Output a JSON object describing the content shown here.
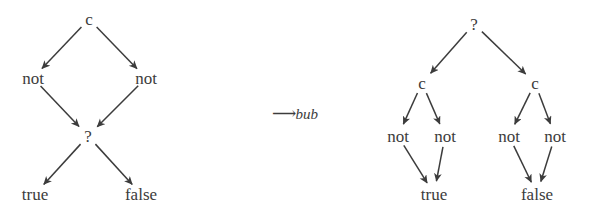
{
  "figure": {
    "kind": "term-rewriting-diagram",
    "background_color": "#ffffff",
    "ink_color": "#3c3c3c",
    "relation": {
      "arrow_glyph": "⟶",
      "name": "bub",
      "full_text": "⟶bub"
    },
    "left_tree": {
      "name": "source-term-tree",
      "nodes": [
        {
          "id": "l-c",
          "label": "c",
          "x": 89,
          "y": 19
        },
        {
          "id": "l-not-1",
          "label": "not",
          "x": 33,
          "y": 78
        },
        {
          "id": "l-not-2",
          "label": "not",
          "x": 146,
          "y": 78
        },
        {
          "id": "l-q",
          "label": "?",
          "x": 88,
          "y": 136
        },
        {
          "id": "l-true",
          "label": "true",
          "x": 35,
          "y": 194
        },
        {
          "id": "l-false",
          "label": "false",
          "x": 141,
          "y": 194
        }
      ],
      "edges": [
        {
          "from": "l-c",
          "to": "l-not-1"
        },
        {
          "from": "l-c",
          "to": "l-not-2"
        },
        {
          "from": "l-not-1",
          "to": "l-q"
        },
        {
          "from": "l-not-2",
          "to": "l-q"
        },
        {
          "from": "l-q",
          "to": "l-true"
        },
        {
          "from": "l-q",
          "to": "l-false"
        }
      ]
    },
    "right_tree": {
      "name": "result-term-tree",
      "nodes": [
        {
          "id": "r-q",
          "label": "?",
          "x": 474,
          "y": 24
        },
        {
          "id": "r-c-1",
          "label": "c",
          "x": 422,
          "y": 83
        },
        {
          "id": "r-c-2",
          "label": "c",
          "x": 535,
          "y": 83
        },
        {
          "id": "r-not-1",
          "label": "not",
          "x": 398,
          "y": 136
        },
        {
          "id": "r-not-2",
          "label": "not",
          "x": 445,
          "y": 136
        },
        {
          "id": "r-not-3",
          "label": "not",
          "x": 509,
          "y": 136
        },
        {
          "id": "r-not-4",
          "label": "not",
          "x": 555,
          "y": 136
        },
        {
          "id": "r-true",
          "label": "true",
          "x": 434,
          "y": 194
        },
        {
          "id": "r-false",
          "label": "false",
          "x": 537,
          "y": 194
        }
      ],
      "edges": [
        {
          "from": "r-q",
          "to": "r-c-1"
        },
        {
          "from": "r-q",
          "to": "r-c-2"
        },
        {
          "from": "r-c-1",
          "to": "r-not-1"
        },
        {
          "from": "r-c-1",
          "to": "r-not-2"
        },
        {
          "from": "r-c-2",
          "to": "r-not-3"
        },
        {
          "from": "r-c-2",
          "to": "r-not-4"
        },
        {
          "from": "r-not-1",
          "to": "r-true"
        },
        {
          "from": "r-not-2",
          "to": "r-true"
        },
        {
          "from": "r-not-3",
          "to": "r-false"
        },
        {
          "from": "r-not-4",
          "to": "r-false"
        }
      ]
    },
    "relation_label_position": {
      "x": 295,
      "y": 113
    }
  }
}
